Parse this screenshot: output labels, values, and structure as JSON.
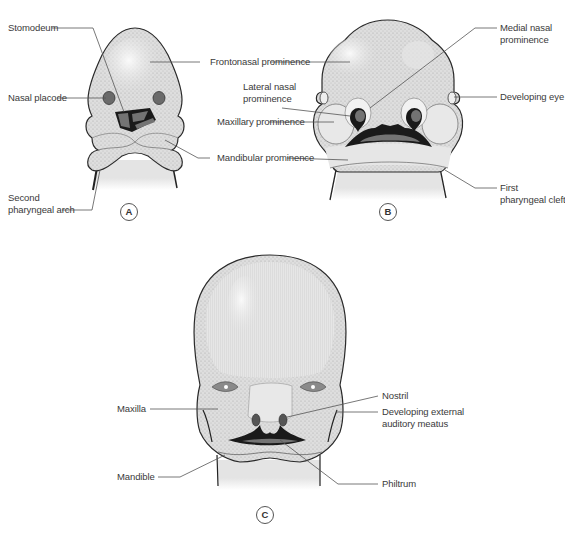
{
  "figure": {
    "colors": {
      "skin": "#e2e2e2",
      "skin_highlight": "#f3f3f3",
      "stipple": "#b9b9b9",
      "outline": "#2a2a2a",
      "cavity_dark": "#1a1a1a",
      "cavity_mid": "#707070",
      "leader_line": "#555555",
      "label_text": "#3a3a3a"
    },
    "panels": [
      {
        "id": "A",
        "letter": "A",
        "labels": [
          {
            "key": "stomodeum",
            "text": "Stomodeum"
          },
          {
            "key": "nasal_placode",
            "text": "Nasal placode"
          },
          {
            "key": "second_pharyngeal_arch_1",
            "text": "Second"
          },
          {
            "key": "second_pharyngeal_arch_2",
            "text": "pharyngeal arch"
          }
        ]
      },
      {
        "id": "B",
        "letter": "B",
        "labels": [
          {
            "key": "medial_nasal_1",
            "text": "Medial nasal"
          },
          {
            "key": "medial_nasal_2",
            "text": "prominence"
          },
          {
            "key": "developing_eye",
            "text": "Developing eye"
          },
          {
            "key": "first_cleft_1",
            "text": "First"
          },
          {
            "key": "first_cleft_2",
            "text": "pharyngeal cleft"
          }
        ]
      },
      {
        "id": "C",
        "letter": "C",
        "labels": [
          {
            "key": "maxilla",
            "text": "Maxilla"
          },
          {
            "key": "mandible",
            "text": "Mandible"
          },
          {
            "key": "nostril",
            "text": "Nostril"
          },
          {
            "key": "ext_auditory_1",
            "text": "Developing external"
          },
          {
            "key": "ext_auditory_2",
            "text": "auditory meatus"
          },
          {
            "key": "philtrum",
            "text": "Philtrum"
          }
        ]
      }
    ],
    "shared_labels": {
      "frontonasal": "Frontonasal prominence",
      "lateral_nasal_1": "Lateral nasal",
      "lateral_nasal_2": "prominence",
      "maxillary": "Maxillary prominence",
      "mandibular": "Mandibular prominence"
    }
  }
}
